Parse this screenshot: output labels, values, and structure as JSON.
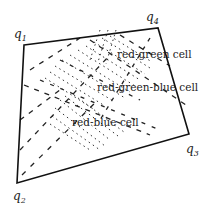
{
  "diagram": {
    "type": "quadrilateral-cell-decomposition",
    "vertices": [
      {
        "id": "q1",
        "label": "q",
        "sub": "1",
        "x": 24,
        "y": 45,
        "lx": 14,
        "ly": 38
      },
      {
        "id": "q4",
        "label": "q",
        "sub": "4",
        "x": 158,
        "y": 28,
        "lx": 146,
        "ly": 21
      },
      {
        "id": "q3",
        "label": "q",
        "sub": "3",
        "x": 189,
        "y": 134,
        "lx": 186,
        "ly": 153
      },
      {
        "id": "q2",
        "label": "q",
        "sub": "2",
        "x": 17,
        "y": 183,
        "lx": 13,
        "ly": 200
      }
    ],
    "cells": [
      {
        "name": "red-green",
        "label": "red-green cell",
        "x": 117,
        "y": 58
      },
      {
        "name": "red-green-blue",
        "label": "red-green-blue cell",
        "x": 97,
        "y": 91
      },
      {
        "name": "red-blue",
        "label": "red-blue cell",
        "x": 72,
        "y": 126
      }
    ],
    "colors": {
      "edge": "#111111",
      "dash": "#222222",
      "text": "#222222",
      "background": "#ffffff"
    }
  }
}
